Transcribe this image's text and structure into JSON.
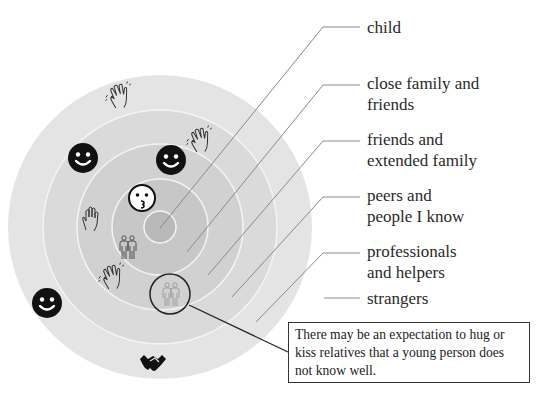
{
  "diagram": {
    "rings": [
      {
        "label": "child",
        "radius": 16,
        "color": "#b9b9b9"
      },
      {
        "label": "close family and friends",
        "radius": 48,
        "color": "#c6c6c6"
      },
      {
        "label": "friends and extended family",
        "radius": 83,
        "color": "#d0d0d0"
      },
      {
        "label": "peers and people I know",
        "radius": 117,
        "color": "#d9d9d9"
      },
      {
        "label": "professionals and helpers",
        "radius": 150,
        "color": "#e3e3e3"
      },
      {
        "label": "strangers",
        "radius": null,
        "color": "#ffffff"
      }
    ],
    "labels": {
      "child": "child",
      "close_family_line1": "close family and",
      "close_family_line2": "friends",
      "friends_line1": "friends and",
      "friends_line2": "extended family",
      "peers_line1": "peers and",
      "peers_line2": "people I know",
      "professionals_line1": "professionals",
      "professionals_line2": "and helpers",
      "strangers": "strangers"
    },
    "icons": [
      {
        "name": "kiss-face-icon",
        "ring": "close family and friends"
      },
      {
        "name": "people-pair-icon",
        "ring": "close family and friends"
      },
      {
        "name": "smiley-face-icon",
        "ring": "friends and extended family"
      },
      {
        "name": "raised-hand-icon",
        "ring": "friends and extended family"
      },
      {
        "name": "waving-hand-icon",
        "ring": "friends and extended family"
      },
      {
        "name": "smiley-face-icon",
        "ring": "peers and people I know"
      },
      {
        "name": "waving-hand-icon",
        "ring": "peers and people I know"
      },
      {
        "name": "waving-hand-icon",
        "ring": "professionals and helpers"
      },
      {
        "name": "smiley-face-icon",
        "ring": "professionals and helpers"
      },
      {
        "name": "handshake-icon",
        "ring": "professionals and helpers"
      },
      {
        "name": "people-pair-icon",
        "ring": "friends and extended family",
        "highlighted": true
      }
    ],
    "callout": {
      "text": "There may be an expectation to hug or kiss relatives that a young person does not know well."
    }
  }
}
